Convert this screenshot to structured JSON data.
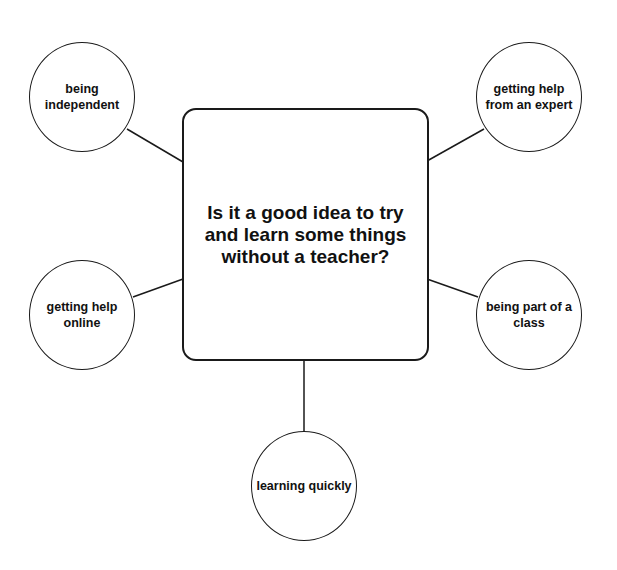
{
  "diagram": {
    "type": "mind-map",
    "central_question": "Is it a good idea to try and learn some things without a teacher?",
    "nodes": [
      {
        "id": "top-left",
        "label": "being independent"
      },
      {
        "id": "top-right",
        "label": "getting help from an expert"
      },
      {
        "id": "middle-left",
        "label": "getting help online"
      },
      {
        "id": "middle-right",
        "label": "being part of a class"
      },
      {
        "id": "bottom",
        "label": "learning quickly"
      }
    ],
    "colors": {
      "stroke": "#1a1a1a",
      "background": "#ffffff",
      "text": "#111111"
    }
  }
}
